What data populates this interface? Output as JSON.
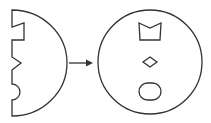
{
  "diagram": {
    "stroke_color": "#333333",
    "background": "#ffffff",
    "left_piece": {
      "shape": "half-disc",
      "notches": [
        "step",
        "triangle",
        "semicircle"
      ]
    },
    "arrow": {
      "direction": "right"
    },
    "right_piece": {
      "shape": "circle",
      "inner_shapes": [
        "notched-trapezoid",
        "diamond",
        "rounded-capsule"
      ]
    }
  }
}
